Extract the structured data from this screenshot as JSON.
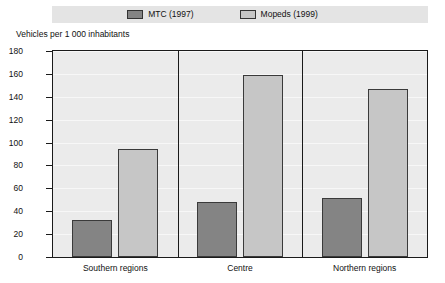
{
  "legend": {
    "entries": [
      {
        "label": "MTC (1997)",
        "color": "#848484",
        "key": "mtc"
      },
      {
        "label": "Mopeds (1999)",
        "color": "#c6c6c6",
        "key": "mopeds"
      }
    ]
  },
  "axis_title": "Vehicles per 1 000 inhabitants",
  "chart_data": {
    "type": "bar",
    "title": "",
    "subtitle": "",
    "xlabel": "",
    "ylabel": "Vehicles per 1 000 inhabitants",
    "categories": [
      "Southern regions",
      "Centre",
      "Northern regions"
    ],
    "series": [
      {
        "name": "MTC (1997)",
        "color": "#848484",
        "values": [
          32,
          48,
          52
        ]
      },
      {
        "name": "Mopeds (1999)",
        "color": "#c6c6c6",
        "values": [
          94,
          159,
          147
        ]
      }
    ],
    "ylim": [
      0,
      180
    ],
    "ytick_values": [
      0,
      20,
      40,
      60,
      80,
      100,
      120,
      140,
      160,
      180
    ],
    "ytick_labels": [
      "0",
      "20",
      "40",
      "60",
      "80",
      "100",
      "120",
      "140",
      "160",
      "180"
    ],
    "grid": true,
    "legend_position": "top"
  }
}
